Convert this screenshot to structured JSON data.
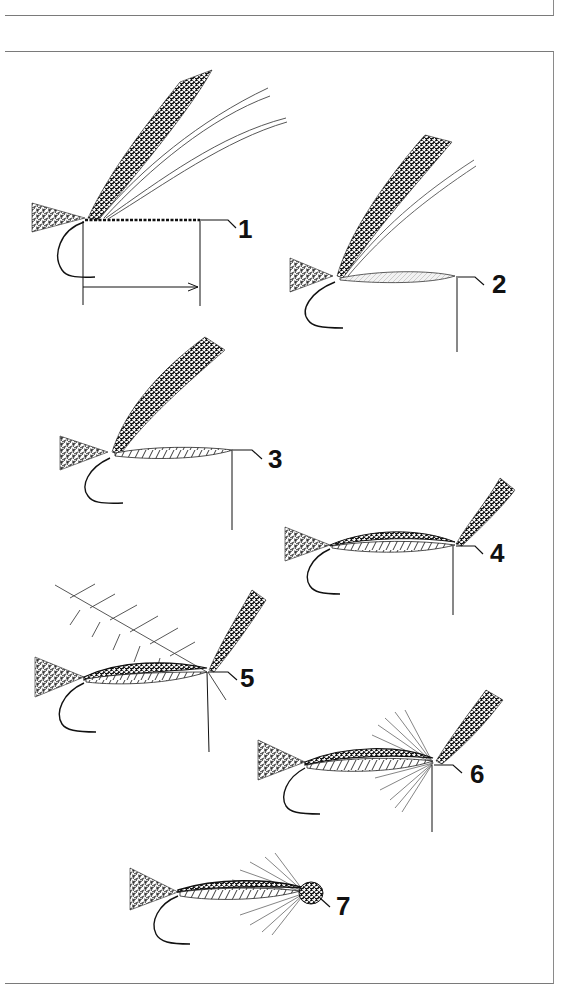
{
  "page": {
    "type": "fly-tying instruction plate",
    "ink_color": "#1a1a1a",
    "border_color": "#7a7a7a",
    "background": "#ffffff"
  },
  "steps": [
    {
      "number": "1",
      "elements": [
        "tail",
        "wing-bundle",
        "hackle-fibers",
        "thread-wraps",
        "hook",
        "measurement-arrow"
      ]
    },
    {
      "number": "2",
      "elements": [
        "tail",
        "wing-bundle",
        "hackle-fibers",
        "underbody",
        "hook",
        "thread"
      ]
    },
    {
      "number": "3",
      "elements": [
        "tail",
        "wing-bundle",
        "ribbed-body",
        "hook",
        "thread"
      ]
    },
    {
      "number": "4",
      "elements": [
        "tail",
        "dubbed-body",
        "ribbed-body",
        "upright-wing",
        "hook",
        "thread"
      ]
    },
    {
      "number": "5",
      "elements": [
        "tail",
        "dubbed-body",
        "hackle-feather",
        "upright-wing",
        "hook",
        "thread"
      ]
    },
    {
      "number": "6",
      "elements": [
        "tail",
        "dubbed-body",
        "wound-hackle",
        "upright-wing",
        "hook",
        "thread"
      ]
    },
    {
      "number": "7",
      "elements": [
        "tail",
        "dubbed-body",
        "swept-hackle",
        "head",
        "hook"
      ]
    }
  ]
}
